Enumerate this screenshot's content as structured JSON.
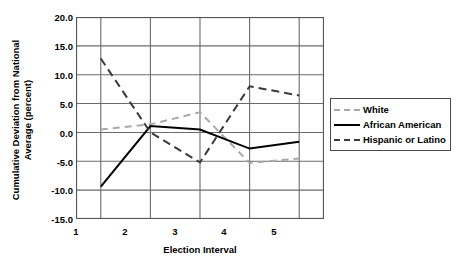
{
  "chart_data": {
    "type": "line",
    "title": "",
    "xlabel": "Election Interval",
    "ylabel": "Cumulative Deviation from National Average (percent)",
    "ylabel_line1": "Cumulative Deviation from National",
    "ylabel_line2": "Average (percent)",
    "categories": [
      "1",
      "2",
      "3",
      "4",
      "5"
    ],
    "x": [
      1,
      2,
      3,
      4,
      5
    ],
    "xlim": [
      0.5,
      5.5
    ],
    "ylim": [
      -15.0,
      20.0
    ],
    "yticks": [
      "20.0",
      "15.0",
      "10.0",
      "5.0",
      "0.0",
      "-5.0",
      "-10.0",
      "-15.0"
    ],
    "ytick_values": [
      20.0,
      15.0,
      10.0,
      5.0,
      0.0,
      -5.0,
      -10.0,
      -15.0
    ],
    "grid": true,
    "legend_position": "right",
    "series": [
      {
        "name": "White",
        "values": [
          0.5,
          1.4,
          3.5,
          -5.3,
          -4.5
        ],
        "style": "dashed",
        "color": "#a9a9a9"
      },
      {
        "name": "African American",
        "values": [
          -9.4,
          1.1,
          0.5,
          -2.8,
          -1.6
        ],
        "style": "solid",
        "color": "#000000"
      },
      {
        "name": "Hispanic or Latino",
        "values": [
          12.8,
          0.0,
          -5.2,
          8.0,
          6.4
        ],
        "style": "dashed",
        "color": "#3a3a3a"
      }
    ]
  },
  "legend": {
    "items": [
      {
        "label": "White"
      },
      {
        "label": "African American"
      },
      {
        "label": "Hispanic or Latino"
      }
    ]
  },
  "colors": {
    "axis": "#555555",
    "grid": "#6b6b6b",
    "white_series": "#a9a9a9",
    "african_american_series": "#000000",
    "hispanic_series": "#3a3a3a",
    "background": "#ffffff"
  }
}
